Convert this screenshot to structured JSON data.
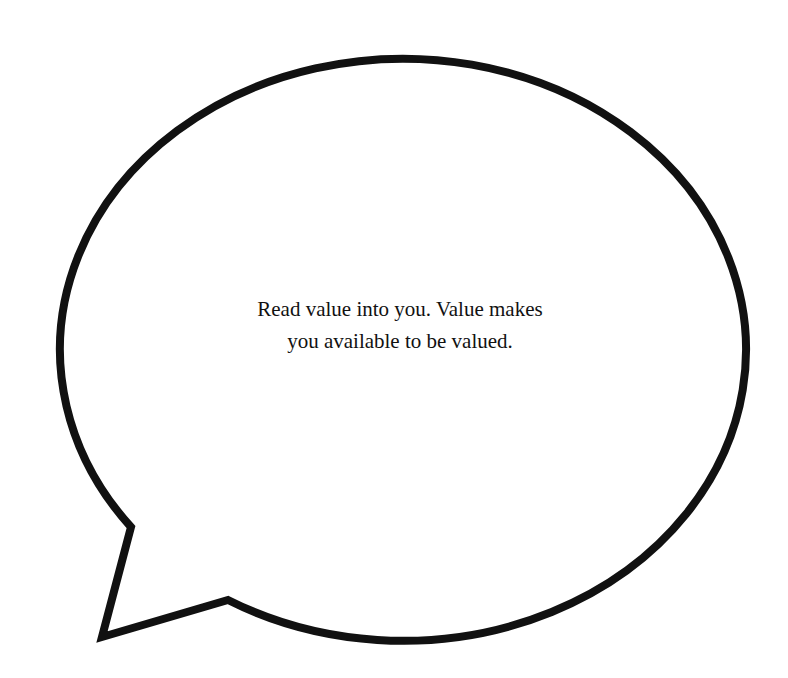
{
  "speech_bubble": {
    "lines": [
      "Read value into you. Value makes",
      "you available to be valued."
    ],
    "stroke_color": "#111111",
    "fill_color": "#ffffff",
    "background_color": "#ffffff"
  }
}
